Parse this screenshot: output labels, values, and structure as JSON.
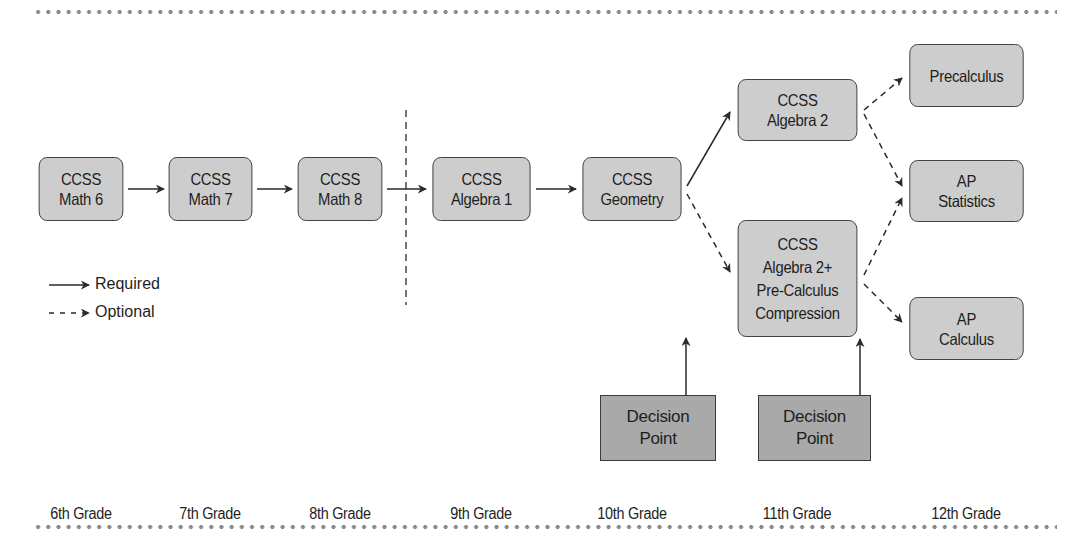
{
  "diagram": {
    "type": "course-pathway-flowchart",
    "nodes": [
      {
        "id": "math6",
        "lines": [
          "CCSS",
          "Math 6"
        ]
      },
      {
        "id": "math7",
        "lines": [
          "CCSS",
          "Math 7"
        ]
      },
      {
        "id": "math8",
        "lines": [
          "CCSS",
          "Math 8"
        ]
      },
      {
        "id": "algebra1",
        "lines": [
          "CCSS",
          "Algebra 1"
        ]
      },
      {
        "id": "geometry",
        "lines": [
          "CCSS",
          "Geometry"
        ]
      },
      {
        "id": "algebra2",
        "lines": [
          "CCSS",
          "Algebra 2"
        ]
      },
      {
        "id": "algebra2plus",
        "lines": [
          "CCSS",
          "Algebra 2+",
          "Pre-Calculus",
          "Compression"
        ]
      },
      {
        "id": "precalculus",
        "lines": [
          "Precalculus"
        ]
      },
      {
        "id": "apstatistics",
        "lines": [
          "AP",
          "Statistics"
        ]
      },
      {
        "id": "apcalculus",
        "lines": [
          "AP",
          "Calculus"
        ]
      }
    ],
    "decision_points": [
      {
        "id": "decision1",
        "lines": [
          "Decision",
          "Point"
        ],
        "points_to": "geometry-to-algebra2plus-path"
      },
      {
        "id": "decision2",
        "lines": [
          "Decision",
          "Point"
        ],
        "points_to": "algebra2plus"
      }
    ],
    "edges": [
      {
        "from": "math6",
        "to": "math7",
        "style": "required"
      },
      {
        "from": "math7",
        "to": "math8",
        "style": "required"
      },
      {
        "from": "math8",
        "to": "algebra1",
        "style": "required"
      },
      {
        "from": "algebra1",
        "to": "geometry",
        "style": "required"
      },
      {
        "from": "geometry",
        "to": "algebra2",
        "style": "required"
      },
      {
        "from": "geometry",
        "to": "algebra2plus",
        "style": "optional"
      },
      {
        "from": "algebra2",
        "to": "precalculus",
        "style": "optional"
      },
      {
        "from": "algebra2",
        "to": "apstatistics",
        "style": "optional"
      },
      {
        "from": "algebra2plus",
        "to": "apstatistics",
        "style": "optional"
      },
      {
        "from": "algebra2plus",
        "to": "apcalculus",
        "style": "optional"
      }
    ],
    "grades": [
      "6th Grade",
      "7th Grade",
      "8th Grade",
      "9th Grade",
      "10th Grade",
      "11th Grade",
      "12th Grade"
    ],
    "legend": {
      "required": "Required",
      "optional": "Optional"
    },
    "colors": {
      "node_fill": "#cdcdcd",
      "decision_fill": "#a9a9a9",
      "stroke": "#3a3a3a",
      "dots": "#8a8a8a"
    }
  }
}
